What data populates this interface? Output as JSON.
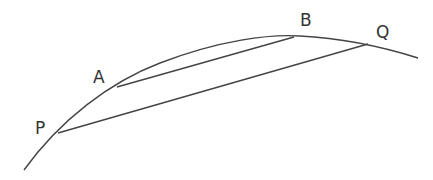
{
  "diagram": {
    "type": "curve-with-chords",
    "colors": {
      "stroke": "#444444",
      "label": "#333333",
      "background": "#ffffff"
    },
    "curve": {
      "start": [
        24,
        170
      ],
      "end": [
        418,
        58
      ]
    },
    "points": [
      {
        "id": "P",
        "label": "P",
        "x": 58,
        "y": 133,
        "label_x": 35,
        "label_y": 134
      },
      {
        "id": "A",
        "label": "A",
        "x": 117,
        "y": 87,
        "label_x": 93,
        "label_y": 83
      },
      {
        "id": "B",
        "label": "B",
        "x": 294,
        "y": 37,
        "label_x": 300,
        "label_y": 26
      },
      {
        "id": "Q",
        "label": "Q",
        "x": 368,
        "y": 44,
        "label_x": 376,
        "label_y": 38
      }
    ],
    "chords": [
      {
        "from": "A",
        "to": "B"
      },
      {
        "from": "P",
        "to": "Q"
      }
    ]
  }
}
